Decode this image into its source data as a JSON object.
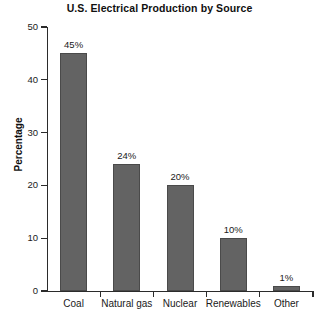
{
  "chart_data": {
    "type": "bar",
    "title": "U.S. Electrical Production by Source",
    "xlabel": "",
    "ylabel": "Percentage",
    "categories": [
      "Coal",
      "Natural gas",
      "Nuclear",
      "Renewables",
      "Other"
    ],
    "values": [
      45,
      24,
      20,
      10,
      1
    ],
    "value_labels": [
      "45%",
      "24%",
      "20%",
      "10%",
      "1%"
    ],
    "ylim": [
      0,
      50
    ],
    "yticks": [
      0,
      10,
      20,
      30,
      40,
      50
    ],
    "ytick_labels": [
      "0",
      "10",
      "20",
      "30",
      "40",
      "50"
    ],
    "grid": false,
    "legend": false,
    "bar_color": "#636363",
    "bar_edge_color": "#4a4a4a",
    "axis_color": "#2b2b2b",
    "background_color": "#ffffff"
  }
}
